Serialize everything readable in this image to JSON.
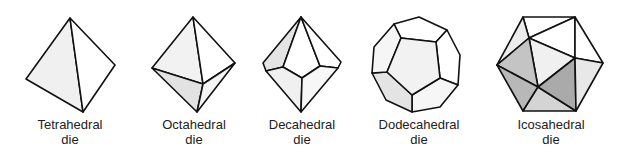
{
  "figure": {
    "dice": [
      {
        "id": "tetrahedral",
        "line1": "Tetrahedral",
        "line2": "die",
        "center_x": 70
      },
      {
        "id": "octahedral",
        "line1": "Octahedral",
        "line2": "die",
        "center_x": 194
      },
      {
        "id": "decahedral",
        "line1": "Decahedral",
        "line2": "die",
        "center_x": 302
      },
      {
        "id": "dodecahedral",
        "line1": "Dodecahedral",
        "line2": "die",
        "center_x": 419
      },
      {
        "id": "icosahedral",
        "line1": "Icosahedral",
        "line2": "die",
        "center_x": 551
      }
    ],
    "colors": {
      "white": "#ffffff",
      "light": "#f2f2f2",
      "lightgray": "#e6e6e6",
      "midgray": "#c8c8c8",
      "darkgray": "#b0b0b0",
      "stroke": "#111111"
    }
  }
}
